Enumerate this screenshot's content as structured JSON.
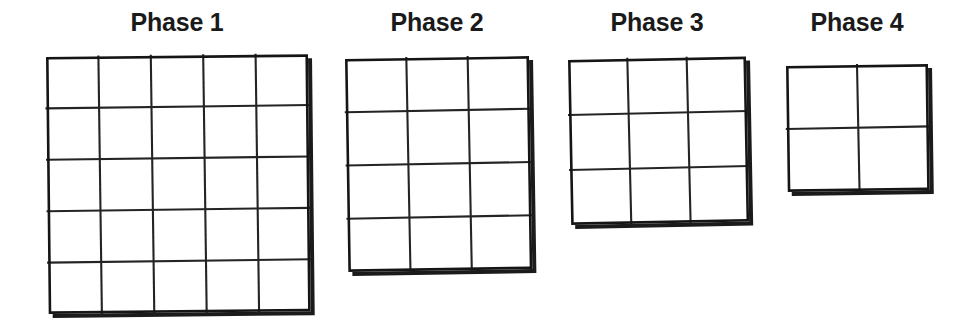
{
  "figure": {
    "title": "",
    "background_color": "#ffffff",
    "line_color": "#242424",
    "text_color": "#1a1a1a",
    "shadow_color": "#1b1b1b"
  },
  "phases": [
    {
      "label": "Phase 1",
      "columns": 5,
      "rows": 5,
      "cell_count": 25,
      "title_left": 46,
      "title_top": 10,
      "title_width": 262,
      "grid_left": 46,
      "grid_top": 57,
      "grid_width": 262,
      "grid_height": 257,
      "rotation_deg": -0.6
    },
    {
      "label": "Phase 2",
      "columns": 3,
      "rows": 4,
      "cell_count": 12,
      "title_left": 345,
      "title_top": 10,
      "title_width": 184,
      "grid_left": 345,
      "grid_top": 59,
      "grid_width": 184,
      "grid_height": 213,
      "rotation_deg": -0.9
    },
    {
      "label": "Phase 3",
      "columns": 3,
      "rows": 3,
      "cell_count": 9,
      "title_left": 568,
      "title_top": 10,
      "title_width": 178,
      "grid_left": 568,
      "grid_top": 60,
      "grid_width": 178,
      "grid_height": 165,
      "rotation_deg": -1.1
    },
    {
      "label": "Phase 4",
      "columns": 2,
      "rows": 2,
      "cell_count": 4,
      "title_left": 786,
      "title_top": 10,
      "title_width": 142,
      "grid_left": 786,
      "grid_top": 66,
      "grid_width": 142,
      "grid_height": 126,
      "rotation_deg": -0.8
    }
  ]
}
